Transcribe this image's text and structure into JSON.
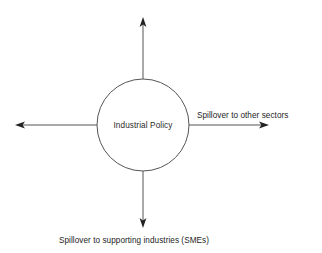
{
  "canvas": {
    "width": 322,
    "height": 253,
    "background": "#ffffff"
  },
  "diagram": {
    "type": "radial-spillover-diagram",
    "stroke_color": "#555555",
    "arrow_color": "#222222",
    "text_color": "#1d1d1d",
    "center_node": {
      "label": "Industrial Policy",
      "shape": "circle",
      "cx": 143,
      "cy": 125,
      "r": 46,
      "fill": "#ffffff"
    },
    "arrows": [
      {
        "name": "up",
        "direction": "up",
        "from_x": 143,
        "from_y": 79,
        "to_x": 143,
        "to_y": 18,
        "label": ""
      },
      {
        "name": "right",
        "direction": "right",
        "from_x": 189,
        "from_y": 125,
        "to_x": 268,
        "to_y": 125,
        "label": "Spillover to other sectors",
        "label_x": 197,
        "label_y": 118
      },
      {
        "name": "down",
        "direction": "down",
        "from_x": 143,
        "from_y": 171,
        "to_x": 143,
        "to_y": 227,
        "label": "Spillover to supporting industries (SMEs)",
        "label_x": 59,
        "label_y": 243
      },
      {
        "name": "left",
        "direction": "left",
        "from_x": 97,
        "from_y": 125,
        "to_x": 16,
        "to_y": 125,
        "label": ""
      }
    ]
  }
}
